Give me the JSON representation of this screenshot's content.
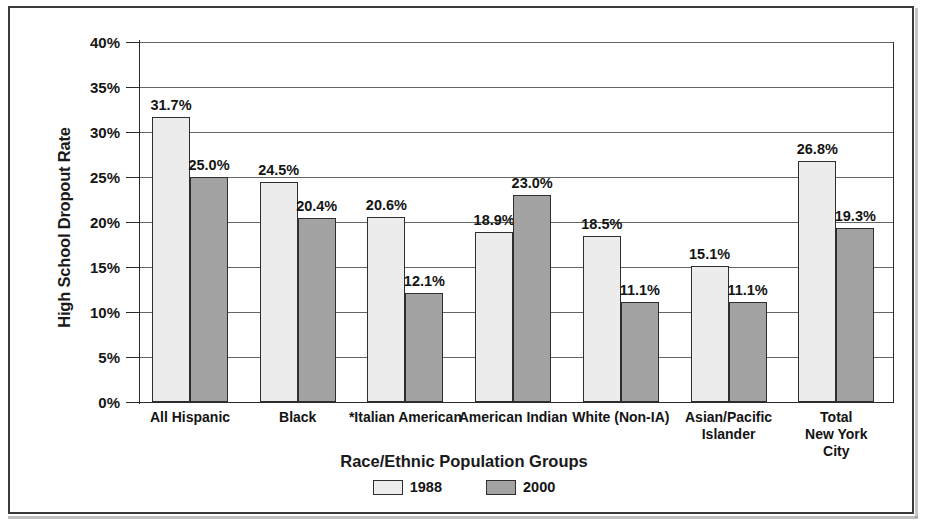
{
  "chart_data": {
    "type": "bar",
    "title": "",
    "xlabel": "Race/Ethnic Population Groups",
    "ylabel": "High School Dropout Rate",
    "ylim": [
      0,
      40
    ],
    "ytick_labels": [
      "40%",
      "35%",
      "30%",
      "25%",
      "20%",
      "15%",
      "10%",
      "5%",
      "0%"
    ],
    "ytick_values": [
      40,
      35,
      30,
      25,
      20,
      15,
      10,
      5,
      0
    ],
    "grid": true,
    "legend_position": "bottom-center",
    "categories": [
      "All Hispanic",
      "Black",
      "*Italian American",
      "American Indian",
      "White (Non-IA)",
      "Asian/Pacific\nIslander",
      "Total\nNew York City"
    ],
    "series": [
      {
        "name": "1988",
        "color": "#ececec",
        "values": [
          31.7,
          24.5,
          20.6,
          18.9,
          18.5,
          15.1,
          26.8
        ],
        "labels": [
          "31.7%",
          "24.5%",
          "20.6%",
          "18.9%",
          "18.5%",
          "15.1%",
          "26.8%"
        ]
      },
      {
        "name": "2000",
        "color": "#a3a3a3",
        "values": [
          25.0,
          20.4,
          12.1,
          23.0,
          11.1,
          11.1,
          19.3
        ],
        "labels": [
          "25.0%",
          "20.4%",
          "12.1%",
          "23.0%",
          "11.1%",
          "11.1%",
          "19.3%"
        ]
      }
    ]
  },
  "legend": {
    "items": [
      {
        "label": "1988",
        "swatch": "s1988"
      },
      {
        "label": "2000",
        "swatch": "s2000"
      }
    ]
  }
}
